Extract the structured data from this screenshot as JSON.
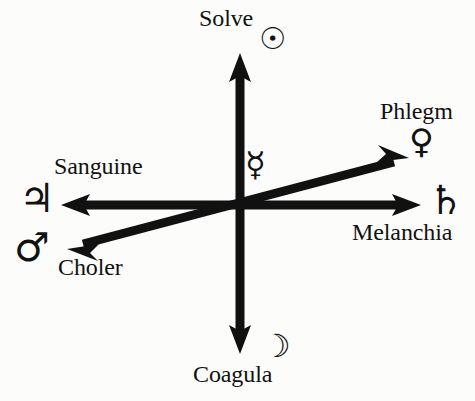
{
  "figure": {
    "background_color": "#fcfcfa",
    "ink_color": "#111111"
  },
  "center": {
    "label": "Mercury",
    "glyph": "☿",
    "glyph_name": "mercury-symbol",
    "x": 240,
    "y": 205
  },
  "axes": [
    {
      "name": "vertical-axis",
      "orientation": "vertical",
      "from": {
        "x": 240,
        "y": 352
      },
      "to": {
        "x": 240,
        "y": 55
      },
      "double_headed": true
    },
    {
      "name": "horizontal-axis",
      "orientation": "horizontal",
      "from": {
        "x": 62,
        "y": 205
      },
      "to": {
        "x": 420,
        "y": 205
      },
      "double_headed": true
    },
    {
      "name": "diagonal-axis",
      "orientation": "diagonal",
      "from": {
        "x": 68,
        "y": 248
      },
      "to": {
        "x": 408,
        "y": 158
      },
      "double_headed": true
    }
  ],
  "poles": [
    {
      "id": "solve",
      "label": "Solve",
      "glyph": "☉",
      "glyph_name": "sun-symbol",
      "planet": "Sun",
      "direction": "up",
      "axis": "vertical-axis"
    },
    {
      "id": "coagula",
      "label": "Coagula",
      "glyph": "☽",
      "glyph_name": "moon-symbol",
      "planet": "Moon",
      "direction": "down",
      "axis": "vertical-axis"
    },
    {
      "id": "sanguine",
      "label": "Sanguine",
      "glyph": "♃",
      "glyph_name": "jupiter-symbol",
      "planet": "Jupiter",
      "direction": "left",
      "axis": "horizontal-axis"
    },
    {
      "id": "melanchia",
      "label": "Melanchia",
      "glyph": "♄",
      "glyph_name": "saturn-symbol",
      "planet": "Saturn",
      "direction": "right",
      "axis": "horizontal-axis"
    },
    {
      "id": "phlegm",
      "label": "Phlegm",
      "glyph": "♀",
      "glyph_name": "venus-symbol",
      "planet": "Venus",
      "direction": "upper-right",
      "axis": "diagonal-axis"
    },
    {
      "id": "choler",
      "label": "Choler",
      "glyph": "♂",
      "glyph_name": "mars-symbol",
      "planet": "Mars",
      "direction": "lower-left",
      "axis": "diagonal-axis"
    }
  ]
}
